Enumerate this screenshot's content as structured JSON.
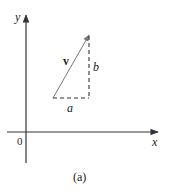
{
  "figure": {
    "caption": "(a)",
    "axes": {
      "x_label": "x",
      "y_label": "y",
      "origin_label": "0"
    },
    "vector": {
      "label": "v",
      "horizontal_component_label": "a",
      "vertical_component_label": "b"
    },
    "colors": {
      "stroke": "#333333",
      "vector": "#777777",
      "text": "#222222"
    }
  }
}
